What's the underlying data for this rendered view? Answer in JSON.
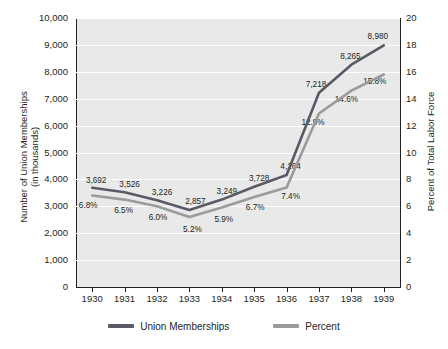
{
  "chart_data": {
    "type": "line",
    "title": "",
    "xlabel": "",
    "categories": [
      "1930",
      "1931",
      "1932",
      "1933",
      "1934",
      "1935",
      "1936",
      "1937",
      "1938",
      "1939"
    ],
    "series": [
      {
        "name": "Union Memberships",
        "axis": "left",
        "color": "#5a5a66",
        "values": [
          3692,
          3526,
          3226,
          2857,
          3249,
          3728,
          4164,
          7218,
          8265,
          8980
        ],
        "value_labels": [
          "3,692",
          "3,526",
          "3,226",
          "2,857",
          "3,249",
          "3,728",
          "4,164",
          "7,218",
          "8,265",
          "8,980"
        ]
      },
      {
        "name": "Percent",
        "axis": "right",
        "color": "#9b9b9b",
        "values": [
          6.8,
          6.5,
          6.0,
          5.2,
          5.9,
          6.7,
          7.4,
          12.9,
          14.6,
          15.8
        ],
        "value_labels": [
          "6.8%",
          "6.5%",
          "6.0%",
          "5.2%",
          "5.9%",
          "6.7%",
          "7.4%",
          "12.9%",
          "14.6%",
          "15.8%"
        ]
      }
    ],
    "left_axis": {
      "label": "Number of Union Memberships (in thousands)",
      "label_line1": "Number of Union Memberships",
      "label_line2": "(in thousands)",
      "min": 0,
      "max": 10000,
      "step": 1000,
      "ticks": [
        "0",
        "1,000",
        "2,000",
        "3,000",
        "4,000",
        "5,000",
        "6,000",
        "7,000",
        "8,000",
        "9,000",
        "10,000"
      ]
    },
    "right_axis": {
      "label": "Percent of Total Labor Force",
      "min": 0,
      "max": 20,
      "step": 2,
      "ticks": [
        "0",
        "2",
        "4",
        "6",
        "8",
        "10",
        "12",
        "14",
        "16",
        "18",
        "20"
      ]
    },
    "grid": true,
    "legend_position": "bottom",
    "legend": [
      {
        "label": "Union Memberships",
        "color": "#5a5a66"
      },
      {
        "label": "Percent",
        "color": "#9b9b9b"
      }
    ],
    "plot_background": "#e9e9e9"
  }
}
